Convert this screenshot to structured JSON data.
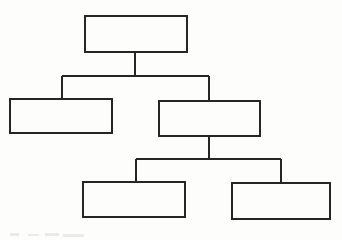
{
  "document": {
    "kind": "scanned tree diagram with empty boxes",
    "background_color": "#fdfdfb",
    "line_color": "#262626",
    "line_width": 2,
    "box_fill": "#fdfdfb",
    "width": 342,
    "height": 240
  },
  "diagram": {
    "type": "tree",
    "levels": 3,
    "nodes": [
      {
        "id": "root",
        "label": "",
        "x": 85,
        "y": 16,
        "w": 102,
        "h": 36
      },
      {
        "id": "level2-left",
        "label": "",
        "x": 10,
        "y": 99,
        "w": 102,
        "h": 34
      },
      {
        "id": "level2-right",
        "label": "",
        "x": 159,
        "y": 101,
        "w": 101,
        "h": 35
      },
      {
        "id": "level3-left",
        "label": "",
        "x": 83,
        "y": 182,
        "w": 102,
        "h": 35
      },
      {
        "id": "level3-right",
        "label": "",
        "x": 232,
        "y": 183,
        "w": 98,
        "h": 36
      }
    ],
    "connectors": [
      {
        "id": "root-stem",
        "x1": 135,
        "y1": 52,
        "x2": 135,
        "y2": 76
      },
      {
        "id": "level2-bus",
        "x1": 62,
        "y1": 76,
        "x2": 209,
        "y2": 76
      },
      {
        "id": "level2-left-drop",
        "x1": 62,
        "y1": 76,
        "x2": 62,
        "y2": 99
      },
      {
        "id": "level2-right-drop",
        "x1": 209,
        "y1": 76,
        "x2": 209,
        "y2": 101
      },
      {
        "id": "level2-right-stem",
        "x1": 209,
        "y1": 136,
        "x2": 209,
        "y2": 159
      },
      {
        "id": "level3-bus",
        "x1": 136,
        "y1": 159,
        "x2": 281,
        "y2": 159
      },
      {
        "id": "level3-left-drop",
        "x1": 136,
        "y1": 159,
        "x2": 136,
        "y2": 182
      },
      {
        "id": "level3-right-drop",
        "x1": 281,
        "y1": 159,
        "x2": 281,
        "y2": 183
      }
    ],
    "scan_artifacts": {
      "color": "#ebebe6",
      "marks": [
        {
          "x": 10,
          "y": 233,
          "w": 9,
          "h": 3
        },
        {
          "x": 28,
          "y": 234,
          "w": 11,
          "h": 2
        },
        {
          "x": 45,
          "y": 233,
          "w": 14,
          "h": 3
        },
        {
          "x": 63,
          "y": 234,
          "w": 21,
          "h": 3
        }
      ]
    }
  }
}
